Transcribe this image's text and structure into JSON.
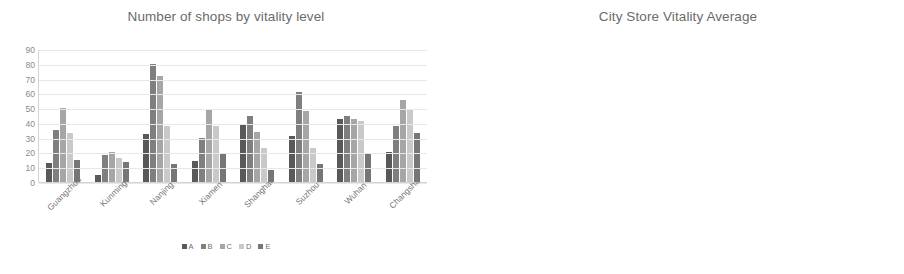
{
  "chart_data": [
    {
      "type": "bar",
      "title": "Number of shops by vitality level",
      "xlabel": "",
      "ylabel": "",
      "ylim": [
        0,
        90
      ],
      "yticks": [
        "0",
        "10",
        "20",
        "30",
        "40",
        "50",
        "60",
        "70",
        "80",
        "90"
      ],
      "grid": true,
      "legend_position": "bottom",
      "categories": [
        "Guangzhou",
        "Kunming",
        "Nanjing",
        "Xiamen",
        "Shanghai",
        "Suzhou",
        "Wuhan",
        "Changsha"
      ],
      "series": [
        {
          "name": "A",
          "color": "#595959",
          "values": [
            13,
            5,
            32.5,
            14.5,
            39.5,
            31,
            42.5,
            20
          ]
        },
        {
          "name": "B",
          "color": "#7f7f7f",
          "values": [
            35.5,
            18,
            80,
            29.5,
            45,
            61,
            44.5,
            38
          ]
        },
        {
          "name": "C",
          "color": "#a6a6a6",
          "values": [
            50,
            20,
            71.5,
            48.5,
            34,
            48,
            42.5,
            55.5
          ]
        },
        {
          "name": "D",
          "color": "#c9c9c9",
          "values": [
            33,
            16,
            38,
            38,
            23,
            23,
            41,
            49
          ]
        },
        {
          "name": "E",
          "color": "#767676",
          "values": [
            15,
            13.5,
            12.5,
            19.5,
            8,
            12,
            19,
            33
          ]
        }
      ]
    },
    {
      "type": "bar",
      "title": "City Store Vitality Average",
      "xlabel": "",
      "ylabel": "",
      "ylim": [
        2,
        3.8
      ],
      "yticks": [
        "2",
        "2.2",
        "2.4",
        "2.6",
        "2.8",
        "3",
        "3.2",
        "3.4",
        "3.6",
        "3.8"
      ],
      "grid": true,
      "legend_position": "none",
      "categories": [
        "Guangzhou",
        "Kunming",
        "Nanjing",
        "Xiamen",
        "Shanghai",
        "Suzhou",
        "Wuhan",
        "Changsha",
        "Average"
      ],
      "series": [
        {
          "name": "Vitality Average",
          "color": "#404040",
          "values": [
            2.99,
            2.81,
            3.35,
            2.88,
            3.6,
            3.45,
            3.69,
            2.82,
            3.23
          ]
        }
      ]
    }
  ],
  "left_chart": {
    "title": "Number of shops by vitality level",
    "legend": [
      {
        "label": "A"
      },
      {
        "label": "B"
      },
      {
        "label": "C"
      },
      {
        "label": "D"
      },
      {
        "label": "E"
      }
    ]
  },
  "right_chart": {
    "title": "City Store Vitality Average"
  }
}
